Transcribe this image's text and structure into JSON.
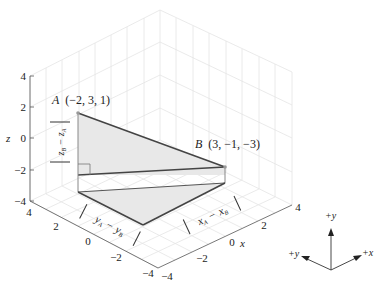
{
  "figure": {
    "title": "",
    "axes": {
      "x": {
        "label": "x",
        "ticks": [
          "−4",
          "−2",
          "0",
          "2",
          "4"
        ]
      },
      "y": {
        "label": "y",
        "ticks": [
          "4",
          "2",
          "0",
          "−2",
          "−4"
        ]
      },
      "z": {
        "label": "z",
        "ticks": [
          "4",
          "2",
          "0",
          "−2",
          "−4"
        ]
      }
    },
    "points": {
      "A": {
        "name": "A",
        "coords": "(−2, 3, 1)"
      },
      "B": {
        "name": "B",
        "coords": "(3, −1, −3)"
      }
    },
    "labels": {
      "z_diff_top": "z",
      "z_diff_top_sub": "A",
      "z_diff_minus": "−",
      "z_diff_bot": "z",
      "z_diff_bot_sub": "B",
      "y_diff_a": "y",
      "y_diff_a_sub": "A",
      "y_diff_minus": "−",
      "y_diff_b": "y",
      "y_diff_b_sub": "B",
      "x_diff_a": "x",
      "x_diff_a_sub": "A",
      "x_diff_minus": "−",
      "x_diff_b": "x",
      "x_diff_b_sub": "B"
    },
    "orientation": {
      "plus_y": "+y",
      "plus_x": "+x",
      "plus_y_left": "+y"
    },
    "colors": {
      "grid": "#e2e2e2",
      "edge": "#444444",
      "fill": "#e6e6e6"
    }
  }
}
